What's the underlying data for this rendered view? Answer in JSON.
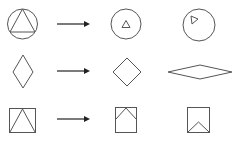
{
  "diagram": {
    "type": "shape-transformation-puzzle",
    "colors": {
      "stroke": "#555555",
      "arrow": "#222222",
      "background": "#ffffff"
    },
    "rows": [
      {
        "source": "circle-with-inscribed-triangle",
        "arrow": "right-arrow",
        "example": "circle-with-small-upright-triangle",
        "option": "circle-with-small-rotated-triangle"
      },
      {
        "source": "tall-diamond",
        "arrow": "right-arrow",
        "example": "square-diamond",
        "option": "wide-flat-diamond"
      },
      {
        "source": "square-with-inscribed-triangle",
        "arrow": "right-arrow",
        "example": "square-with-roof-chevron-top",
        "option": "square-with-chevron-bottom"
      }
    ]
  }
}
